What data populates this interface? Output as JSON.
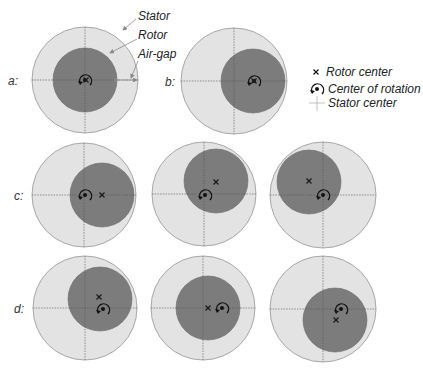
{
  "annotations": {
    "stator": "Stator",
    "rotor": "Rotor",
    "air_gap": "Air-gap"
  },
  "legend": {
    "rotor_center": "Rotor center",
    "center_of_rotation": "Center of rotation",
    "stator_center": "Stator center"
  },
  "rows": [
    {
      "label": "a:"
    },
    {
      "label": "b:"
    },
    {
      "label": "c:"
    },
    {
      "label": "d:"
    }
  ],
  "colors": {
    "stator": "#e3e3e3",
    "rotor": "#7c7c7c"
  }
}
